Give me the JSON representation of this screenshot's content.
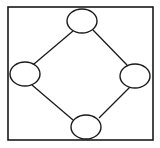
{
  "diagram": {
    "type": "graph",
    "width": 160,
    "height": 148,
    "background": "#ffffff",
    "stroke_color": "#1a1a1a",
    "frame": {
      "x": 8,
      "y": 7,
      "width": 145,
      "height": 133
    },
    "nodes": [
      {
        "id": "top",
        "label": "",
        "cx": 82,
        "cy": 21,
        "rx": 15,
        "ry": 12
      },
      {
        "id": "left",
        "label": "",
        "cx": 25,
        "cy": 74,
        "rx": 15,
        "ry": 12
      },
      {
        "id": "right",
        "label": "",
        "cx": 135,
        "cy": 76,
        "rx": 15,
        "ry": 12
      },
      {
        "id": "bottom",
        "label": "",
        "cx": 86,
        "cy": 127,
        "rx": 15,
        "ry": 12
      }
    ],
    "edges": [
      {
        "from": "top",
        "to": "left"
      },
      {
        "from": "top",
        "to": "right"
      },
      {
        "from": "left",
        "to": "bottom"
      },
      {
        "from": "right",
        "to": "bottom"
      }
    ]
  }
}
